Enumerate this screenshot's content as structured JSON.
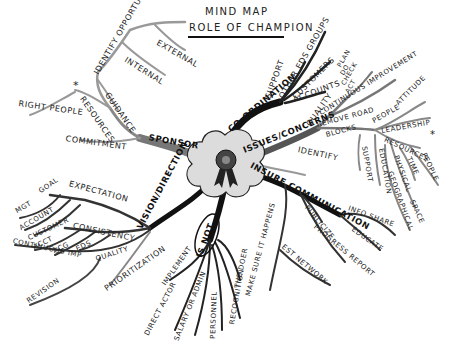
{
  "title": {
    "line1": "MIND MAP",
    "line2": "ROLE OF CHAMPION"
  },
  "center": {
    "icon": "ribbon-rosette-icon"
  },
  "branches": {
    "sponsor": {
      "label": "SPONSOR",
      "children": {
        "identify_opportunities": "IDENTIFY OPPORTUNITIES",
        "external": "EXTERNAL",
        "internal": "INTERNAL",
        "guidance": "GUIDANCE",
        "resources": "RESOURCES",
        "star": "*",
        "right_people": "RIGHT PEOPLE",
        "commitment": "COMMITMENT"
      }
    },
    "coordination": {
      "label": "CO-ORDINATION",
      "children": {
        "support": "SUPPORT",
        "other_eds_groups": "OTHER EDS GROUPS",
        "customers": "CUSTOMERS",
        "accounts": "ACCOUNTS"
      }
    },
    "issues": {
      "label": "ISSUES/CONCERNS",
      "children": {
        "quality": "QUALITY",
        "plan": "PLAN",
        "do": "DO",
        "check": "CHECK",
        "act": "ACT",
        "continuous_improvement": "CONTINUOUS IMPROVEMENT",
        "remove_road_blocks_1": "REMOVE ROAD",
        "remove_road_blocks_2": "BLOCKS",
        "people": "PEOPLE",
        "attitude": "ATTITUDE",
        "leadership": "LEADERSHIP",
        "resources": "RESOURCES",
        "star": "*",
        "people2": "PEOPLE",
        "time": "TIME",
        "physical": "PHYSICAL",
        "space": "SPACE",
        "geographical": "GEOGRAPHICAL",
        "education": "EDUCATION",
        "support": "SUPPORT",
        "identify": "IDENTIFY"
      }
    },
    "insure_communication": {
      "label": "INSURE COMMUNICATION",
      "children": {
        "publicize": "PUBLICIZE",
        "progress_report": "PROGRESS REPORT",
        "info_share": "INFO SHARE",
        "educate": "EDUCATE",
        "make_sure": "MAKE SURE IT HAPPENS",
        "est_network": "EST NETWORK"
      }
    },
    "is_not": {
      "label": "IS NOT",
      "children": {
        "implement": "IMPLEMENT",
        "direct_actor": "DIRECT ACTOR",
        "salary": "SALARY OR ADMIN",
        "personnel": "PERSONNEL",
        "recognition": "RECOGNITION",
        "the_doer": "THE DOER"
      }
    },
    "vision": {
      "label": "VISION/DIRECTION",
      "children": {
        "goal": "GOAL",
        "expectation": "EXPECTATION",
        "mgt": "MGT",
        "account": "ACCOUNT",
        "customer": "CUSTOMER",
        "consistency": "CONSISTENCY",
        "acct": "ACCT",
        "acg": "ACG",
        "eds": "EDS",
        "continuous_imp": "CONTINUOUS IMP",
        "quality": "QUALITY",
        "revision": "REVISION",
        "prioritization": "PRIORITIZATION"
      }
    }
  }
}
